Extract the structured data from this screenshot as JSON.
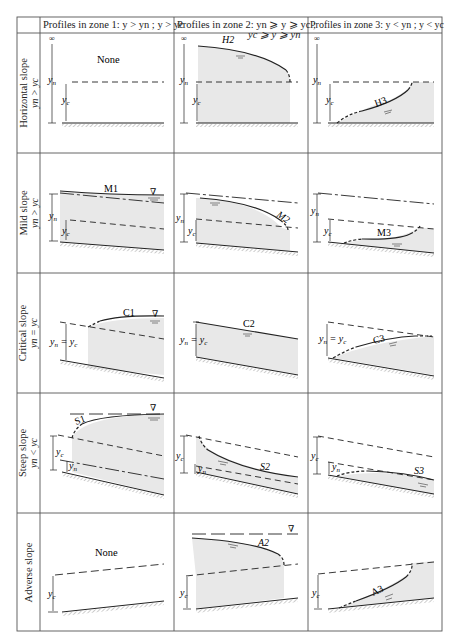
{
  "header": {
    "corner": "",
    "zone1": "Profiles in zone 1: y > yn ; y > yc",
    "zone2_line1": "Profiles in zone 2: yn ⩾ y ⩾ yc ;",
    "zone2_line2": "yc ⩾ y ⩾ yn",
    "zone3": "Profiles in zone 3: y < yn ; y < yc"
  },
  "rows": [
    {
      "label": "Horizontal slope",
      "condition": "yn > yc",
      "zone1": "None",
      "zone2": "H2",
      "zone3": "H3",
      "depth_labels": {
        "infinity": "∞",
        "yn": "yn",
        "yc": "yc"
      }
    },
    {
      "label": "Mild slope",
      "condition": "yn > yc",
      "zone1": "M1",
      "zone2": "M2",
      "zone3": "M3",
      "depth_labels": {
        "yn": "yn",
        "yc": "yc"
      }
    },
    {
      "label": "Critical slope",
      "condition": "yn = yc",
      "zone1": "C1",
      "zone2": "C2",
      "zone3": "C3",
      "depth_labels": {
        "ynyc": "yn = yc"
      }
    },
    {
      "label": "Steep slope",
      "condition": "yn < yc",
      "zone1": "S1",
      "zone2": "S2",
      "zone3": "S3",
      "depth_labels": {
        "yn": "yn",
        "yc": "yc"
      }
    },
    {
      "label": "Adverse slope",
      "condition": "",
      "zone1": "None",
      "zone2": "A2",
      "zone3": "A3",
      "depth_labels": {
        "yc": "yc"
      }
    }
  ],
  "symbols": {
    "water_surface": "∇"
  },
  "colors": {
    "line": "#222222",
    "grid": "#555555",
    "water": "#e6e6e6",
    "hatch": "#999999"
  }
}
